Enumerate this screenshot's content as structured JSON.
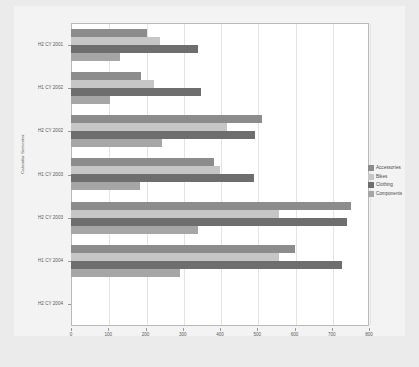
{
  "chart_data": {
    "type": "bar",
    "orientation": "horizontal",
    "title": "",
    "xlabel": "",
    "ylabel": "Calendar Semester",
    "xlim": [
      0,
      800
    ],
    "xticks": [
      0,
      100,
      200,
      300,
      400,
      500,
      600,
      700,
      800
    ],
    "xtick_labels": [
      "0",
      "100",
      "200",
      "300",
      "400",
      "500",
      "600",
      "700",
      "800"
    ],
    "grid": true,
    "grid_axis": "x",
    "legend_position": "right",
    "categories": [
      "H2 CY 2001",
      "H1 CY 2002",
      "H2 CY 2002",
      "H1 CY 2003",
      "H2 CY 2003",
      "H1 CY 2004",
      "H2 CY 2004"
    ],
    "series": [
      {
        "name": "Accessories",
        "color": "#8c8c8c",
        "values": [
          205,
          188,
          513,
          383,
          752,
          600,
          0
        ]
      },
      {
        "name": "Bikes",
        "color": "#c6c6c6",
        "values": [
          240,
          222,
          418,
          400,
          558,
          558,
          0
        ]
      },
      {
        "name": "Clothing",
        "color": "#6e6e6e",
        "values": [
          342,
          348,
          494,
          490,
          740,
          728,
          0
        ]
      },
      {
        "name": "Components",
        "color": "#a6a6a6",
        "values": [
          132,
          104,
          245,
          186,
          342,
          292,
          0
        ]
      }
    ]
  },
  "legend": {
    "items": [
      {
        "label": "Accessories",
        "color": "#8c8c8c"
      },
      {
        "label": "Bikes",
        "color": "#c6c6c6"
      },
      {
        "label": "Clothing",
        "color": "#6e6e6e"
      },
      {
        "label": "Components",
        "color": "#a6a6a6"
      }
    ]
  },
  "axes": {
    "y_title": "Calendar Semester"
  },
  "colors": {
    "background": "#ebebeb",
    "canvas": "#f3f3f3",
    "plot_background": "#ffffff",
    "plot_border": "#b9b9b9",
    "gridline": "#e3e3e3",
    "tick_text": "#5a5a5a"
  }
}
